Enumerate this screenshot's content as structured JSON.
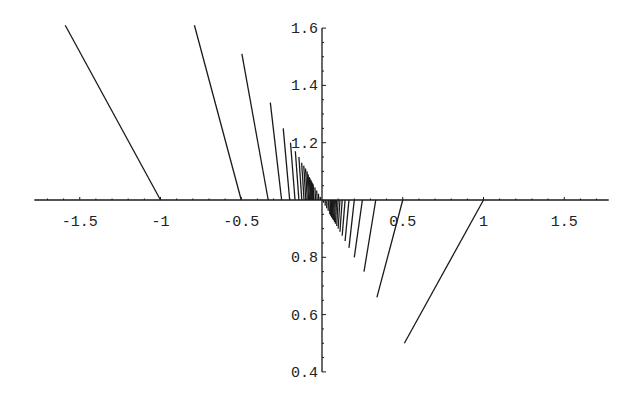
{
  "chart_data": {
    "type": "line",
    "title": "",
    "xlabel": "",
    "ylabel": "",
    "xlim": [
      -1.8,
      1.8
    ],
    "ylim": [
      0.4,
      1.6
    ],
    "axes_cross_at": {
      "x": 0,
      "y": 1.0
    },
    "grid": false,
    "legend": null,
    "x_ticks": [
      {
        "value": -1.5,
        "label": "-1.5"
      },
      {
        "value": -1,
        "label": "-1"
      },
      {
        "value": -0.5,
        "label": "-0.5"
      },
      {
        "value": 0.5,
        "label": "0.5"
      },
      {
        "value": 1,
        "label": "1"
      },
      {
        "value": 1.5,
        "label": "1.5"
      }
    ],
    "y_ticks": [
      {
        "value": 1.6,
        "label": "1.6"
      },
      {
        "value": 1.4,
        "label": "1.4"
      },
      {
        "value": 1.2,
        "label": "1.2"
      },
      {
        "value": 0.8,
        "label": "0.8"
      },
      {
        "value": 0.6,
        "label": "0.6"
      },
      {
        "value": 0.4,
        "label": "0.4"
      }
    ],
    "series": [
      {
        "name": "segments-left",
        "description": "Family of line segments starting on the x-axis at x=-1/n (y=1) rising to the upper left",
        "segments": [
          [
            [
              -1.0,
              1.0
            ],
            [
              -1.59,
              1.61
            ]
          ],
          [
            [
              -0.5,
              1.0
            ],
            [
              -0.79,
              1.61
            ]
          ],
          [
            [
              -0.333,
              1.0
            ],
            [
              -0.496,
              1.51
            ]
          ],
          [
            [
              -0.25,
              1.0
            ],
            [
              -0.32,
              1.34
            ]
          ],
          [
            [
              -0.2,
              1.0
            ],
            [
              -0.24,
              1.25
            ]
          ],
          [
            [
              -0.167,
              1.0
            ],
            [
              -0.195,
              1.2
            ]
          ],
          [
            [
              -0.143,
              1.0
            ],
            [
              -0.165,
              1.17
            ]
          ],
          [
            [
              -0.125,
              1.0
            ],
            [
              -0.143,
              1.15
            ]
          ],
          [
            [
              -0.111,
              1.0
            ],
            [
              -0.126,
              1.13
            ]
          ],
          [
            [
              -0.1,
              1.0
            ],
            [
              -0.113,
              1.12
            ]
          ],
          [
            [
              -0.091,
              1.0
            ],
            [
              -0.102,
              1.11
            ]
          ],
          [
            [
              -0.083,
              1.0
            ],
            [
              -0.093,
              1.1
            ]
          ],
          [
            [
              -0.077,
              1.0
            ],
            [
              -0.086,
              1.09
            ]
          ],
          [
            [
              -0.071,
              1.0
            ],
            [
              -0.079,
              1.08
            ]
          ],
          [
            [
              -0.067,
              1.0
            ],
            [
              -0.074,
              1.075
            ]
          ],
          [
            [
              -0.0625,
              1.0
            ],
            [
              -0.069,
              1.07
            ]
          ],
          [
            [
              -0.059,
              1.0
            ],
            [
              -0.065,
              1.065
            ]
          ],
          [
            [
              -0.056,
              1.0
            ],
            [
              -0.061,
              1.06
            ]
          ],
          [
            [
              -0.053,
              1.0
            ],
            [
              -0.058,
              1.057
            ]
          ],
          [
            [
              -0.05,
              1.0
            ],
            [
              -0.055,
              1.054
            ]
          ],
          [
            [
              -0.04,
              1.0
            ],
            [
              -0.044,
              1.044
            ]
          ],
          [
            [
              -0.03,
              1.0
            ],
            [
              -0.033,
              1.033
            ]
          ],
          [
            [
              -0.02,
              1.0
            ],
            [
              -0.022,
              1.022
            ]
          ],
          [
            [
              -0.01,
              1.0
            ],
            [
              -0.011,
              1.011
            ]
          ]
        ]
      },
      {
        "name": "segments-right",
        "description": "Family of line segments starting on the x-axis at x=1/n (y=1) descending to the lower left",
        "segments": [
          [
            [
              1.0,
              1.0
            ],
            [
              0.51,
              0.5
            ]
          ],
          [
            [
              0.5,
              1.0
            ],
            [
              0.34,
              0.66
            ]
          ],
          [
            [
              0.333,
              1.0
            ],
            [
              0.26,
              0.75
            ]
          ],
          [
            [
              0.25,
              1.0
            ],
            [
              0.2,
              0.8
            ]
          ],
          [
            [
              0.2,
              1.0
            ],
            [
              0.167,
              0.833
            ]
          ],
          [
            [
              0.167,
              1.0
            ],
            [
              0.143,
              0.857
            ]
          ],
          [
            [
              0.143,
              1.0
            ],
            [
              0.125,
              0.875
            ]
          ],
          [
            [
              0.125,
              1.0
            ],
            [
              0.111,
              0.889
            ]
          ],
          [
            [
              0.111,
              1.0
            ],
            [
              0.1,
              0.9
            ]
          ],
          [
            [
              0.1,
              1.0
            ],
            [
              0.091,
              0.909
            ]
          ],
          [
            [
              0.091,
              1.0
            ],
            [
              0.083,
              0.917
            ]
          ],
          [
            [
              0.083,
              1.0
            ],
            [
              0.077,
              0.923
            ]
          ],
          [
            [
              0.077,
              1.0
            ],
            [
              0.071,
              0.929
            ]
          ],
          [
            [
              0.071,
              1.0
            ],
            [
              0.067,
              0.933
            ]
          ],
          [
            [
              0.067,
              1.0
            ],
            [
              0.0625,
              0.9375
            ]
          ],
          [
            [
              0.0625,
              1.0
            ],
            [
              0.059,
              0.941
            ]
          ],
          [
            [
              0.059,
              1.0
            ],
            [
              0.056,
              0.944
            ]
          ],
          [
            [
              0.056,
              1.0
            ],
            [
              0.053,
              0.947
            ]
          ],
          [
            [
              0.053,
              1.0
            ],
            [
              0.05,
              0.95
            ]
          ],
          [
            [
              0.05,
              1.0
            ],
            [
              0.048,
              0.952
            ]
          ],
          [
            [
              0.04,
              1.0
            ],
            [
              0.038,
              0.962
            ]
          ],
          [
            [
              0.03,
              1.0
            ],
            [
              0.029,
              0.971
            ]
          ],
          [
            [
              0.02,
              1.0
            ],
            [
              0.0196,
              0.98
            ]
          ],
          [
            [
              0.01,
              1.0
            ],
            [
              0.0099,
              0.99
            ]
          ]
        ]
      }
    ]
  },
  "style": {
    "line_color": "#1a1a1a",
    "axis_color": "#1a1a1a",
    "background": "#ffffff"
  }
}
